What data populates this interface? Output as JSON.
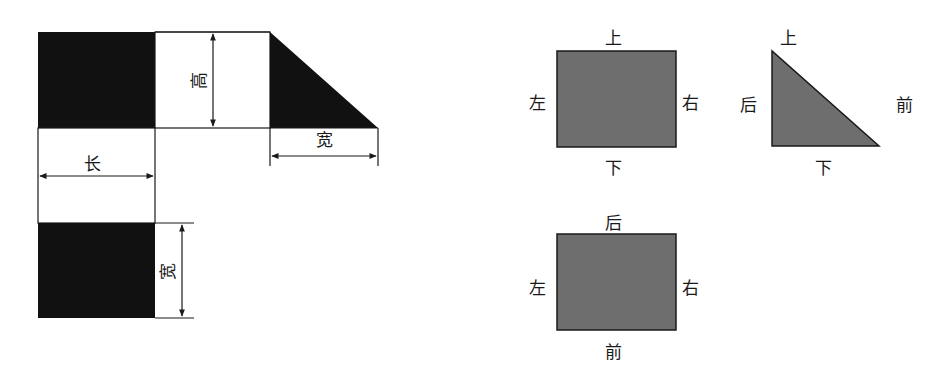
{
  "colors": {
    "net_fill": "#111111",
    "view_fill": "#6e6e6e",
    "line": "#1a1a1a",
    "background": "#ffffff"
  },
  "net_diagram": {
    "dimension_labels": {
      "height": "高",
      "length": "长",
      "width_top": "宽",
      "width_bottom": "宽"
    }
  },
  "view_front": {
    "labels": {
      "top": "上",
      "left": "左",
      "right": "右",
      "bottom": "下"
    }
  },
  "view_side": {
    "labels": {
      "top": "上",
      "left": "后",
      "right": "前",
      "bottom": "下"
    }
  },
  "view_top": {
    "labels": {
      "top": "后",
      "left": "左",
      "right": "右",
      "bottom": "前"
    }
  }
}
